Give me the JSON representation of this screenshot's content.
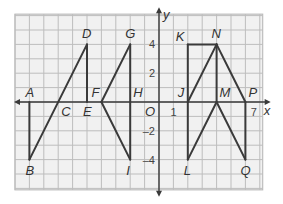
{
  "diagram": {
    "type": "coordinate-grid",
    "grid": {
      "x_min": -10,
      "x_max": 7.2,
      "y_min": -6.1,
      "y_max": 6.1,
      "unit_px": 14.4,
      "origin_px": [
        159,
        102
      ]
    },
    "axes": {
      "x_label": "x",
      "y_label": "y",
      "origin_label": "O",
      "x_ticks": [
        {
          "value": 1,
          "label": "1"
        },
        {
          "value": 7,
          "label": "7"
        }
      ],
      "y_ticks": [
        {
          "value": 4,
          "label": "4"
        },
        {
          "value": 2,
          "label": "2"
        },
        {
          "value": -2,
          "label": "–2"
        },
        {
          "value": -4,
          "label": "–4"
        }
      ]
    },
    "colors": {
      "grid_line": "#bdbdbd",
      "grid_fill": "#f1f1f1",
      "figure_line": "#3a3a3a",
      "axis": "#3a3a3a"
    },
    "points": [
      {
        "name": "A",
        "x": -9,
        "y": 0,
        "label_dx": -4,
        "label_dy": -5
      },
      {
        "name": "B",
        "x": -9,
        "y": -4,
        "label_dx": -4,
        "label_dy": 15
      },
      {
        "name": "C",
        "x": -7,
        "y": 0,
        "label_dx": 3,
        "label_dy": 14
      },
      {
        "name": "D",
        "x": -5,
        "y": 4,
        "label_dx": -5,
        "label_dy": -6
      },
      {
        "name": "E",
        "x": -5,
        "y": 0,
        "label_dx": -4,
        "label_dy": 14
      },
      {
        "name": "F",
        "x": -4,
        "y": 0,
        "label_dx": -10,
        "label_dy": -5
      },
      {
        "name": "G",
        "x": -2,
        "y": 4,
        "label_dx": -5,
        "label_dy": -6
      },
      {
        "name": "H",
        "x": -2,
        "y": 0,
        "label_dx": 3,
        "label_dy": -5
      },
      {
        "name": "I",
        "x": -2,
        "y": -4,
        "label_dx": -4,
        "label_dy": 15
      },
      {
        "name": "J",
        "x": 2,
        "y": 0,
        "label_dx": -10,
        "label_dy": -5
      },
      {
        "name": "K",
        "x": 2,
        "y": 4,
        "label_dx": -12,
        "label_dy": -3
      },
      {
        "name": "N",
        "x": 4,
        "y": 4,
        "label_dx": -5,
        "label_dy": -6
      },
      {
        "name": "M",
        "x": 4,
        "y": 0,
        "label_dx": 3,
        "label_dy": -5
      },
      {
        "name": "P",
        "x": 6,
        "y": 0,
        "label_dx": 3,
        "label_dy": -5
      },
      {
        "name": "L",
        "x": 2,
        "y": -4,
        "label_dx": -4,
        "label_dy": 15
      },
      {
        "name": "Q",
        "x": 6,
        "y": -4,
        "label_dx": -5,
        "label_dy": 15
      }
    ],
    "segments": [
      [
        "A",
        "B"
      ],
      [
        "B",
        "D"
      ],
      [
        "D",
        "E"
      ],
      [
        "F",
        "G"
      ],
      [
        "G",
        "I"
      ],
      [
        "F",
        "I"
      ],
      [
        "K",
        "N"
      ],
      [
        "K",
        "L"
      ],
      [
        "J",
        "N"
      ],
      [
        "N",
        "M"
      ],
      [
        "N",
        "P"
      ],
      [
        "M",
        "L"
      ],
      [
        "M",
        "Q"
      ],
      [
        "P",
        "Q"
      ]
    ]
  }
}
